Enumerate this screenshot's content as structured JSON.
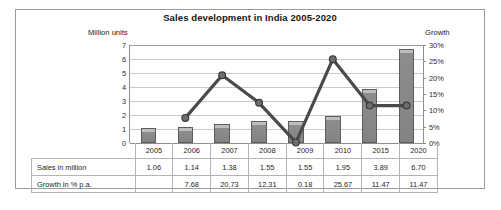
{
  "chart_data": {
    "type": "bar",
    "title": "Sales development in India 2005-2020",
    "xlabel": "",
    "ylabel": "Million units",
    "y2label": "Growth",
    "ylim": [
      0,
      7
    ],
    "y2lim": [
      0,
      30
    ],
    "yticks": [
      "0",
      "1",
      "2",
      "3",
      "4",
      "5",
      "6",
      "7"
    ],
    "y2ticks": [
      "0%",
      "5%",
      "10%",
      "15%",
      "20%",
      "25%",
      "30%"
    ],
    "grid": true,
    "legend": "none",
    "categories": [
      "2005",
      "2006",
      "2007",
      "2008",
      "2009",
      "2010",
      "2015",
      "2020"
    ],
    "series": [
      {
        "name": "Sales in million",
        "type": "bar",
        "axis": "left",
        "values": [
          1.06,
          1.14,
          1.38,
          1.55,
          1.55,
          1.95,
          3.89,
          6.7
        ]
      },
      {
        "name": "Growth in % p.a.",
        "type": "line",
        "axis": "right",
        "values": [
          null,
          7.68,
          20.73,
          12.31,
          0.18,
          25.67,
          11.47,
          11.47
        ]
      }
    ]
  },
  "table": {
    "header_row_label": "",
    "columns": [
      "2005",
      "2006",
      "2007",
      "2008",
      "2009",
      "2010",
      "2015",
      "2020"
    ],
    "rows": [
      {
        "label": "Sales in million",
        "values": [
          "1.06",
          "1.14",
          "1.38",
          "1.55",
          "1.55",
          "1.95",
          "3.89",
          "6.70"
        ]
      },
      {
        "label": "Growth in % p.a.",
        "values": [
          "",
          "7.68",
          "20.73",
          "12.31",
          "0.18",
          "25.67",
          "11.47",
          "11.47"
        ]
      }
    ]
  },
  "colors": {
    "bar_fill": "#8d8d8d",
    "bar_border": "#5c5c5c",
    "line": "#4a4a4a",
    "grid": "#c9c9c9",
    "axis": "#8e8e8e",
    "text": "#1d1d1d"
  }
}
